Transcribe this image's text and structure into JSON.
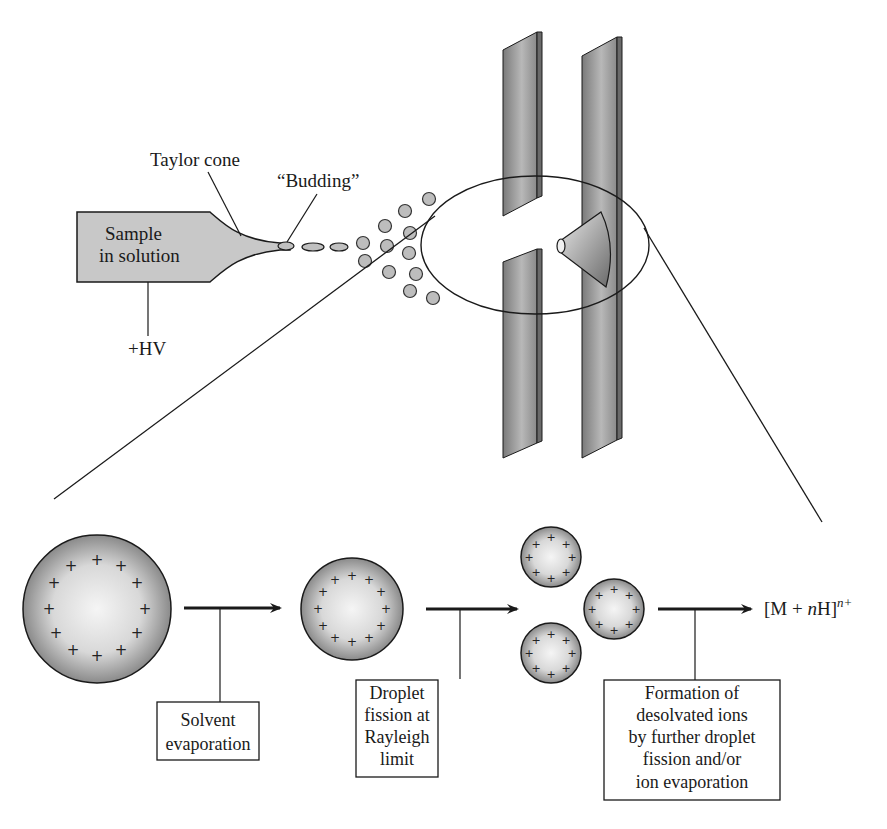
{
  "diagram": {
    "source_labels": {
      "taylor_cone": "Taylor cone",
      "budding": "“Budding”",
      "sample_line1": "Sample",
      "sample_line2": "in solution",
      "high_voltage": "+HV"
    },
    "steps": [
      {
        "id": "solvent-evaporation",
        "lines": [
          "Solvent",
          "evaporation"
        ]
      },
      {
        "id": "droplet-fission",
        "lines": [
          "Droplet",
          "fission at",
          "Rayleigh",
          "limit"
        ]
      },
      {
        "id": "ion-formation",
        "lines": [
          "Formation of",
          "desolvated ions",
          "by further droplet",
          "fission and/or",
          "ion evaporation"
        ]
      }
    ],
    "product": {
      "prefix": "[M + ",
      "italic_n": "n",
      "suffix": "H]",
      "superscript": "n+"
    },
    "droplets": [
      {
        "name": "large-droplet",
        "charges": 12
      },
      {
        "name": "medium-droplet",
        "charges": 12
      },
      {
        "name": "offspring-droplet",
        "charges": 8,
        "count": 3
      }
    ],
    "colors": {
      "capillary_fill": "#c8c8c8",
      "plate_fill": "#8c8c8c",
      "droplet_center": "#f4f4f4",
      "droplet_edge": "#8a8a8a",
      "stroke": "#1a1a1a"
    }
  }
}
